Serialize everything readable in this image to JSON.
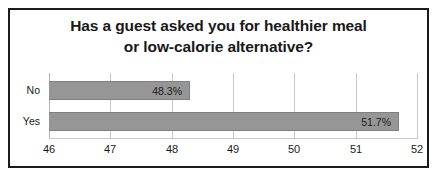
{
  "chart_data": {
    "type": "bar",
    "orientation": "horizontal",
    "title": "Has a guest asked you for healthier meal or low-calorie alternative?",
    "title_lines": [
      "Has a guest asked you for healthier meal",
      "or low-calorie alternative?"
    ],
    "categories": [
      "No",
      "Yes"
    ],
    "values": [
      48.3,
      51.7
    ],
    "value_labels": [
      "48.3%",
      "51.7%"
    ],
    "xlabel": "",
    "ylabel": "",
    "xlim": [
      46,
      52
    ],
    "xticks": [
      46,
      47,
      48,
      49,
      50,
      51,
      52
    ],
    "xtick_labels": [
      "46",
      "47",
      "48",
      "49",
      "50",
      "51",
      "52"
    ],
    "grid": true,
    "grid_axis": "x",
    "legend": false,
    "legend_position": "none",
    "series": [
      {
        "name": "",
        "values": [
          48.3,
          51.7
        ]
      }
    ],
    "colors": {
      "bar_fill": "#969696",
      "bar_border": "#808080",
      "grid": "#c9c9c9",
      "text": "#19191a",
      "frame": "#1b1b1b",
      "background": "#ffffff"
    }
  }
}
